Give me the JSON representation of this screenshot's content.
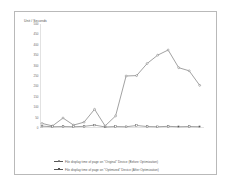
{
  "chart_data": {
    "type": "line",
    "title": "",
    "ylabel": "Unit / Seconds",
    "xlabel": "",
    "ylim": [
      0,
      500
    ],
    "yticks": [
      0,
      50,
      100,
      150,
      200,
      250,
      300,
      350,
      400,
      450,
      500
    ],
    "grid": false,
    "legend_position": "bottom",
    "categories": [
      "www.google.com",
      "www.facebook.com",
      "www.youtube.com",
      "www.yahoo.com",
      "www.baidu.com",
      "www.wikipedia.org",
      "www.amazon.com",
      "www.twitter.com",
      "www.taobao.com",
      "www.live.com",
      "www.linkedin.com",
      "www.sina.com.cn",
      "www.blogspot.com",
      "www.bing.com",
      "www.msn.com",
      "www.ebay.com"
    ],
    "series": [
      {
        "name": "File display time of page on \"Original\" Device (Before Optimization)",
        "marker": "circle",
        "color": "#555555",
        "values": [
          22,
          10,
          48,
          14,
          28,
          90,
          10,
          58,
          250,
          252,
          310,
          350,
          375,
          290,
          275,
          205
        ]
      },
      {
        "name": "File display time of page on \"Optimized\" Device (After Optimization)",
        "marker": "square",
        "color": "#555555",
        "values": [
          9,
          6,
          7,
          6,
          8,
          14,
          5,
          7,
          6,
          12,
          7,
          6,
          8,
          6,
          7,
          6
        ]
      }
    ]
  },
  "legend": {
    "items": [
      "File display time of page on \"Original\" Device (Before Optimization)",
      "File display time of page on \"Optimized\" Device (After Optimization)"
    ]
  }
}
